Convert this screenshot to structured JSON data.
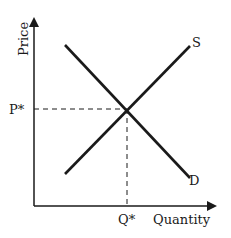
{
  "diagram": {
    "type": "supply-demand",
    "axes": {
      "y_label": "Price",
      "x_label": "Quantity"
    },
    "curves": [
      {
        "name": "S",
        "label": "S",
        "from": [
          65,
          174
        ],
        "to": [
          190,
          46
        ]
      },
      {
        "name": "D",
        "label": "D",
        "from": [
          65,
          45
        ],
        "to": [
          190,
          178
        ]
      }
    ],
    "equilibrium": {
      "price_label": "P*",
      "quantity_label": "Q*"
    },
    "colors": {
      "line": "#1a1a1a",
      "background": "#ffffff"
    }
  }
}
